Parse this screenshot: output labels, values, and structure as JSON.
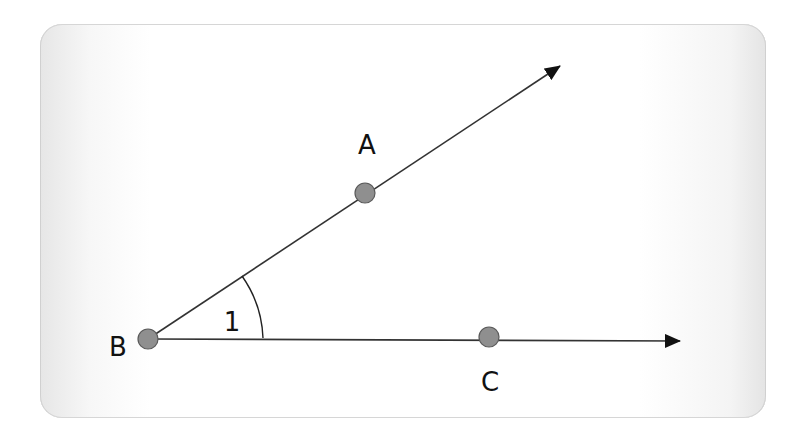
{
  "diagram": {
    "points": [
      {
        "name": "A",
        "label": "A",
        "x": 365,
        "y": 193,
        "label_x": 367,
        "label_y": 154
      },
      {
        "name": "B",
        "label": "B",
        "x": 148,
        "y": 339,
        "label_x": 118,
        "label_y": 356
      },
      {
        "name": "C",
        "label": "C",
        "x": 489,
        "y": 337,
        "label_x": 490,
        "label_y": 391
      }
    ],
    "rays": [
      {
        "name": "ray-BA",
        "from": "B",
        "through": "A",
        "tip_x": 560,
        "tip_y": 65
      },
      {
        "name": "ray-BC",
        "from": "B",
        "through": "C",
        "tip_x": 680,
        "tip_y": 341
      }
    ],
    "angle": {
      "label": "1",
      "vertex": "B",
      "label_x": 232,
      "label_y": 331
    },
    "colors": {
      "line": "#222222",
      "point_fill": "#8f8f8f",
      "point_stroke": "#555555",
      "text": "#111111",
      "card_edge": "#e4e4e4"
    }
  }
}
